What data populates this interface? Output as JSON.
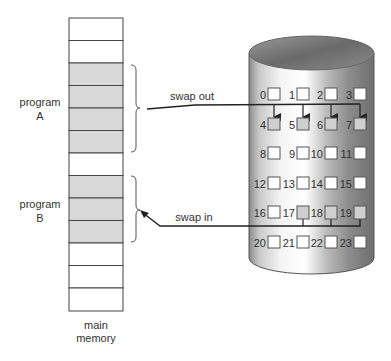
{
  "diagram": {
    "type": "swapping",
    "memory": {
      "label_line1": "main",
      "label_line2": "memory",
      "blocks": [
        {
          "index": 0,
          "shaded": false
        },
        {
          "index": 1,
          "shaded": false
        },
        {
          "index": 2,
          "shaded": true
        },
        {
          "index": 3,
          "shaded": true
        },
        {
          "index": 4,
          "shaded": true
        },
        {
          "index": 5,
          "shaded": true
        },
        {
          "index": 6,
          "shaded": false
        },
        {
          "index": 7,
          "shaded": true
        },
        {
          "index": 8,
          "shaded": true
        },
        {
          "index": 9,
          "shaded": true
        },
        {
          "index": 10,
          "shaded": false
        },
        {
          "index": 11,
          "shaded": false
        },
        {
          "index": 12,
          "shaded": false
        }
      ]
    },
    "programs": [
      {
        "name_line1": "program",
        "name_line2": "A"
      },
      {
        "name_line1": "program",
        "name_line2": "B"
      }
    ],
    "arrows": {
      "swap_out": "swap out",
      "swap_in": "swap in"
    },
    "disk": {
      "slots": [
        {
          "id": "0",
          "shaded": false
        },
        {
          "id": "1",
          "shaded": false
        },
        {
          "id": "2",
          "shaded": false
        },
        {
          "id": "3",
          "shaded": false
        },
        {
          "id": "4",
          "shaded": true
        },
        {
          "id": "5",
          "shaded": true
        },
        {
          "id": "6",
          "shaded": true
        },
        {
          "id": "7",
          "shaded": true
        },
        {
          "id": "8",
          "shaded": false
        },
        {
          "id": "9",
          "shaded": false
        },
        {
          "id": "10",
          "shaded": false
        },
        {
          "id": "11",
          "shaded": false
        },
        {
          "id": "12",
          "shaded": false
        },
        {
          "id": "13",
          "shaded": false
        },
        {
          "id": "14",
          "shaded": false
        },
        {
          "id": "15",
          "shaded": false
        },
        {
          "id": "16",
          "shaded": false
        },
        {
          "id": "17",
          "shaded": true
        },
        {
          "id": "18",
          "shaded": true
        },
        {
          "id": "19",
          "shaded": true
        },
        {
          "id": "20",
          "shaded": false
        },
        {
          "id": "21",
          "shaded": false
        },
        {
          "id": "22",
          "shaded": false
        },
        {
          "id": "23",
          "shaded": false
        }
      ]
    },
    "colors": {
      "shaded_fill": "#d8d8d8",
      "line": "#333333"
    }
  }
}
